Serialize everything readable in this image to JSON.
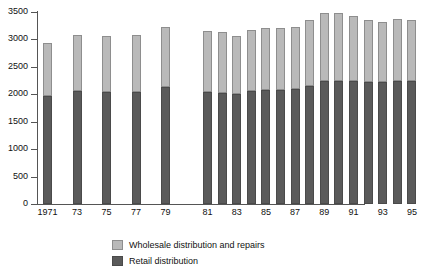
{
  "chart_data": {
    "type": "bar",
    "subtype": "stacked-vertical",
    "title": "",
    "subtitle": "",
    "xlabel": "",
    "ylabel": "",
    "ylim": [
      0,
      3500
    ],
    "yticks": [
      0,
      500,
      1000,
      1500,
      2000,
      2500,
      3000,
      3500
    ],
    "ytick_labels": [
      "0",
      "500",
      "1000",
      "1500",
      "2000",
      "2500",
      "3000",
      "3500"
    ],
    "grid": false,
    "legend_position": "bottom",
    "categories": [
      "1971",
      "1973",
      "1975",
      "1977",
      "1979",
      "1981",
      "1982",
      "1983",
      "1984",
      "1985",
      "1986",
      "1987",
      "1988",
      "1989",
      "1990",
      "1991",
      "1992",
      "1993",
      "1994",
      "1995"
    ],
    "xtick_labels": [
      "1971",
      "73",
      "75",
      "77",
      "79",
      "81",
      "83",
      "85",
      "87",
      "89",
      "91",
      "93",
      "95"
    ],
    "series": [
      {
        "name": "Retail distribution",
        "color": "#5a5a5a",
        "values": [
          1960,
          2060,
          2050,
          2050,
          2140,
          2040,
          2030,
          2000,
          2060,
          2070,
          2080,
          2090,
          2150,
          2240,
          2250,
          2250,
          2230,
          2220,
          2250,
          2250
        ]
      },
      {
        "name": "Wholesale distribution and repairs",
        "color": "#b9b9b9",
        "values": [
          970,
          1030,
          1020,
          1030,
          1090,
          1110,
          1100,
          1070,
          1120,
          1130,
          1130,
          1140,
          1200,
          1250,
          1240,
          1180,
          1120,
          1090,
          1130,
          1110
        ]
      }
    ],
    "totals": [
      2930,
      3090,
      3070,
      3080,
      3230,
      3150,
      3130,
      3070,
      3180,
      3200,
      3210,
      3230,
      3350,
      3490,
      3490,
      3430,
      3350,
      3310,
      3380,
      3360
    ],
    "legend": [
      {
        "label": "Wholesale distribution and repairs",
        "color": "#b9b9b9",
        "swatch": "wholesale"
      },
      {
        "label": "Retail distribution",
        "color": "#5a5a5a",
        "swatch": "retail"
      }
    ]
  }
}
